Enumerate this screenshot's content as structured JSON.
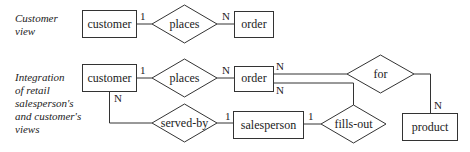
{
  "captions": {
    "customer_view": [
      "Customer",
      "view"
    ],
    "integration": [
      "Integration",
      "of retail",
      "salesperson's",
      "and customer's",
      "views"
    ]
  },
  "customer_view": {
    "entities": {
      "customer": "customer",
      "order": "order"
    },
    "relationships": {
      "places": "places"
    },
    "cardinalities": {
      "customer_places": "1",
      "places_order": "N"
    }
  },
  "integrated_view": {
    "entities": {
      "customer": "customer",
      "order": "order",
      "salesperson": "salesperson",
      "product": "product"
    },
    "relationships": {
      "places": "places",
      "for": "for",
      "served_by": "served-by",
      "fills_out": "fills-out"
    },
    "cardinalities": {
      "customer_places": "1",
      "places_order": "N",
      "order_for": "N",
      "order_fills_out": "N",
      "for_product": "N",
      "customer_served_by": "N",
      "served_by_salesperson": "1",
      "salesperson_fills_out": "1"
    }
  },
  "colors": {
    "stroke": "#333333",
    "text": "#222222",
    "background": "#ffffff"
  }
}
